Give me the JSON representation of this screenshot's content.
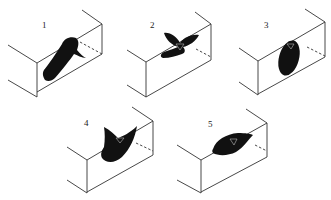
{
  "figure": {
    "panels": [
      {
        "label": "1",
        "shape": "tilted elongated blob"
      },
      {
        "label": "2",
        "shape": "butterfly / four-lobed"
      },
      {
        "label": "3",
        "shape": "oval"
      },
      {
        "label": "4",
        "shape": "fan / curved wedge"
      },
      {
        "label": "5",
        "shape": "horizontal elongated lens"
      }
    ]
  }
}
